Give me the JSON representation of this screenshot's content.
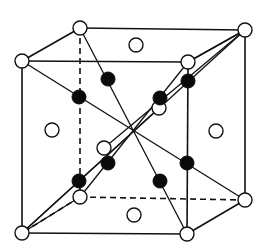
{
  "diagram": {
    "title": "",
    "type": "crystal-unit-cell",
    "colors": {
      "line": "#111111",
      "open_atom_fill": "#ffffff",
      "filled_atom": "#0a0a0a",
      "background": "#ffffff"
    },
    "corners": {
      "back_top_left": [
        80,
        28
      ],
      "back_top_right": [
        245,
        30
      ],
      "front_top_left": [
        22,
        61
      ],
      "front_top_right": [
        188,
        62
      ],
      "back_bottom_left": [
        80,
        197
      ],
      "back_bottom_right": [
        245,
        200
      ],
      "front_bottom_left": [
        22,
        233
      ],
      "front_bottom_right": [
        187,
        234
      ]
    },
    "open_atoms": [
      {
        "name": "corner-btl",
        "x": 80,
        "y": 28
      },
      {
        "name": "corner-btr",
        "x": 245,
        "y": 30
      },
      {
        "name": "corner-ftl",
        "x": 22,
        "y": 61
      },
      {
        "name": "corner-ftr",
        "x": 188,
        "y": 62
      },
      {
        "name": "corner-bbl",
        "x": 80,
        "y": 197
      },
      {
        "name": "corner-bbr",
        "x": 245,
        "y": 200
      },
      {
        "name": "corner-fbl",
        "x": 22,
        "y": 233
      },
      {
        "name": "corner-fbr",
        "x": 187,
        "y": 234
      },
      {
        "name": "face-top",
        "x": 136,
        "y": 45
      },
      {
        "name": "face-left",
        "x": 52,
        "y": 130
      },
      {
        "name": "face-right",
        "x": 216,
        "y": 131
      },
      {
        "name": "face-bottom",
        "x": 134,
        "y": 215
      },
      {
        "name": "face-back",
        "x": 159,
        "y": 108
      },
      {
        "name": "face-front",
        "x": 104,
        "y": 148
      }
    ],
    "filled_atoms": [
      {
        "name": "tet-1",
        "x": 79,
        "y": 97
      },
      {
        "name": "tet-2",
        "x": 108,
        "y": 79
      },
      {
        "name": "tet-3",
        "x": 188,
        "y": 81
      },
      {
        "name": "tet-4",
        "x": 160,
        "y": 98
      },
      {
        "name": "tet-5",
        "x": 108,
        "y": 163
      },
      {
        "name": "tet-6",
        "x": 79,
        "y": 181
      },
      {
        "name": "tet-7",
        "x": 187,
        "y": 163
      },
      {
        "name": "tet-8",
        "x": 160,
        "y": 181
      }
    ],
    "center": [
      134,
      130
    ]
  }
}
